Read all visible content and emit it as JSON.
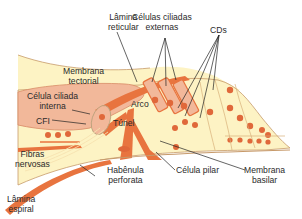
{
  "diagram": {
    "colors": {
      "background": "#ffffff",
      "tissue_light": "#fdf3c4",
      "tissue_pink": "#f2b89a",
      "membrane_orange": "#e8743f",
      "nucleus": "#e0683a",
      "outline": "#c79a6a",
      "leader_line": "#222222"
    },
    "labels": {
      "lamina_reticular": [
        "Lâmina",
        "reticular"
      ],
      "celulas_ciliadas_externas": [
        "Células ciliadas",
        "externas"
      ],
      "cds": [
        "CDs"
      ],
      "membrana_tectorial": [
        "Membrana",
        "tectorial"
      ],
      "celula_ciliada_interna": [
        "Célula ciliada",
        "interna"
      ],
      "arco": [
        "Arco"
      ],
      "cfi": [
        "CFI"
      ],
      "tunel": [
        "Túnel"
      ],
      "fibras_nervosas": [
        "Fibras",
        "nervosas"
      ],
      "habenula_perforata": [
        "Habênula",
        "perforata"
      ],
      "celula_pilar": [
        "Célula pilar"
      ],
      "membrana_basilar": [
        "Membrana",
        "basilar"
      ],
      "lamina_espiral": [
        "Lâmina",
        "espiral"
      ]
    }
  }
}
